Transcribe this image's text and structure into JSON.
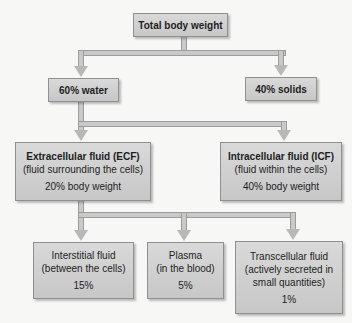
{
  "diagram": {
    "root": {
      "label": "Total body weight"
    },
    "level1": [
      {
        "label": "60% water"
      },
      {
        "label": "40% solids"
      }
    ],
    "level2": [
      {
        "title": "Extracellular fluid (ECF)",
        "description": "(fluid surrounding the cells)",
        "percent": "20% body weight"
      },
      {
        "title": "Intracellular fluid (ICF)",
        "description": "(fluid within the cells)",
        "percent": "40% body weight"
      }
    ],
    "level3": [
      {
        "title": "Interstitial fluid",
        "description": "(between the cells)",
        "percent": "15%"
      },
      {
        "title": "Plasma",
        "description": "(in the blood)",
        "percent": "5%"
      },
      {
        "title": "Transcellular fluid",
        "description": "(actively secreted in small quantities)",
        "percent": "1%"
      }
    ],
    "edges": [
      [
        "Total body weight",
        "60% water"
      ],
      [
        "Total body weight",
        "40% solids"
      ],
      [
        "60% water",
        "Extracellular fluid (ECF)"
      ],
      [
        "60% water",
        "Intracellular fluid (ICF)"
      ],
      [
        "Extracellular fluid (ECF)",
        "Interstitial fluid"
      ],
      [
        "Extracellular fluid (ECF)",
        "Plasma"
      ],
      [
        "Extracellular fluid (ECF)",
        "Transcellular fluid"
      ]
    ],
    "colors": {
      "box_fill": "#d0d0d0",
      "connector": "#c9c9c9",
      "border": "#8f8f8f",
      "background": "#f7f7f5"
    }
  }
}
